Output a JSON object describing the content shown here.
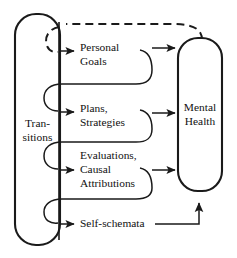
{
  "diagram": {
    "type": "flow-diagram",
    "title": "",
    "source_node": {
      "id": "transitions",
      "label_lines": [
        "Tran-",
        "sitions"
      ],
      "full_label": "Transitions",
      "shape": "rounded-rectangle"
    },
    "mediator_nodes": [
      {
        "id": "personal-goals",
        "label_lines": [
          "Personal",
          "Goals"
        ],
        "full_label": "Personal Goals",
        "order": 1
      },
      {
        "id": "plans-strategies",
        "label_lines": [
          "Plans,",
          "Strategies"
        ],
        "full_label": "Plans, Strategies",
        "order": 2
      },
      {
        "id": "evaluations-causal-attributions",
        "label_lines": [
          "Evaluations,",
          "Causal",
          "Attributions"
        ],
        "full_label": "Evaluations, Causal Attributions",
        "order": 3
      },
      {
        "id": "self-schemata",
        "label_lines": [
          "Self-schemata"
        ],
        "full_label": "Self-schemata",
        "order": 4
      }
    ],
    "outcome_node": {
      "id": "mental-health",
      "label_lines": [
        "Mental",
        "Health"
      ],
      "full_label": "Mental Health",
      "shape": "rounded-rectangle"
    },
    "edges": [
      {
        "from": "transitions",
        "to": "personal-goals",
        "style": "solid-arrow"
      },
      {
        "from": "transitions",
        "to": "plans-strategies",
        "style": "solid-arrow"
      },
      {
        "from": "transitions",
        "to": "evaluations-causal-attributions",
        "style": "solid-arrow"
      },
      {
        "from": "transitions",
        "to": "self-schemata",
        "style": "solid-arrow"
      },
      {
        "from": "personal-goals",
        "to": "mental-health",
        "style": "solid-arrow"
      },
      {
        "from": "plans-strategies",
        "to": "mental-health",
        "style": "solid-arrow"
      },
      {
        "from": "evaluations-causal-attributions",
        "to": "mental-health",
        "style": "solid-arrow"
      },
      {
        "from": "self-schemata",
        "to": "mental-health",
        "style": "solid-arrow-elbow-up"
      },
      {
        "from": "personal-goals",
        "to": "plans-strategies",
        "style": "solid-loopback"
      },
      {
        "from": "plans-strategies",
        "to": "evaluations-causal-attributions",
        "style": "solid-loopback"
      },
      {
        "from": "evaluations-causal-attributions",
        "to": "self-schemata",
        "style": "solid-loopback"
      },
      {
        "from": "mental-health",
        "to": "transitions",
        "style": "dashed-feedback"
      }
    ],
    "colors": {
      "stroke": "#1a1a1a",
      "text": "#111111",
      "background": "#ffffff"
    }
  }
}
